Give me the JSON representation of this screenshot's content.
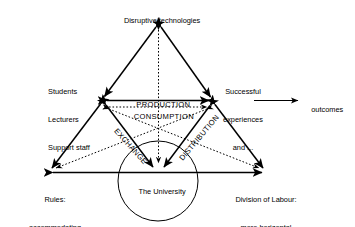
{
  "diagram": {
    "type": "engestrom-activity-triangle",
    "colors": {
      "stroke": "#000000",
      "background": "#ffffff",
      "text": "#000000"
    },
    "nodes": {
      "top": {
        "id": "mediating-artefact",
        "label": "Disruptive technologies"
      },
      "left": {
        "id": "subject",
        "label_lines": [
          "Students",
          "Lecturers",
          "Support staff"
        ],
        "line1": "Students",
        "line2": "Lecturers",
        "line3": "Support staff"
      },
      "right": {
        "id": "object",
        "label_lines": [
          "Successful",
          "experiences",
          "and ..."
        ],
        "line1": "Successful",
        "line2": "experiences",
        "line3": "and ..."
      },
      "bottom_left": {
        "id": "rules",
        "label_lines": [
          "Rules:",
          "accommodating",
          "disruptive",
          "technologies"
        ],
        "line1": "Rules:",
        "line2": "accommodating",
        "line3": "disruptive",
        "line4": "technologies"
      },
      "bottom_center": {
        "id": "community",
        "label": "The University"
      },
      "bottom_right": {
        "id": "division-of-labour",
        "label_lines": [
          "Division of Labour:",
          "more horizontal"
        ],
        "line1": "Division of Labour:",
        "line2": "more horizontal"
      },
      "outcome": {
        "id": "outcome",
        "label": "outcomes"
      }
    },
    "edge_labels": {
      "production": "PRODUCTION",
      "consumption": "CONSUMPTION",
      "exchange": "EXCHANGE",
      "distribution": "DISTRIBUTION"
    }
  }
}
